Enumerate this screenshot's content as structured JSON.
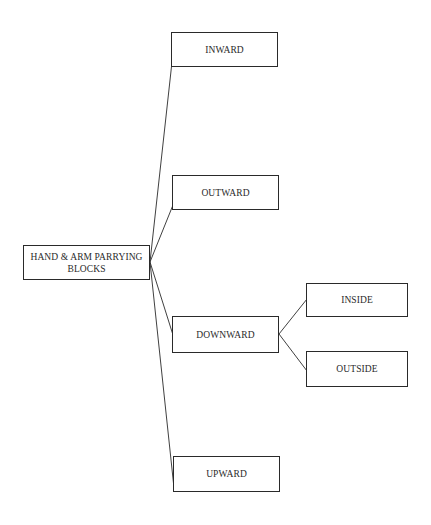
{
  "diagram": {
    "type": "tree",
    "root": {
      "id": "root",
      "label_line1": "HAND & ARM PARRYING",
      "label_line2": "BLOCKS",
      "box": {
        "x": 23,
        "y": 245,
        "w": 127,
        "h": 35
      }
    },
    "nodes": [
      {
        "id": "inward",
        "label": "INWARD",
        "parent": "root",
        "box": {
          "x": 171,
          "y": 32,
          "w": 107,
          "h": 35
        }
      },
      {
        "id": "outward",
        "label": "OUTWARD",
        "parent": "root",
        "box": {
          "x": 172,
          "y": 175,
          "w": 107,
          "h": 35
        }
      },
      {
        "id": "downward",
        "label": "DOWNWARD",
        "parent": "root",
        "box": {
          "x": 172,
          "y": 316,
          "w": 107,
          "h": 37
        }
      },
      {
        "id": "inside",
        "label": "INSIDE",
        "parent": "downward",
        "box": {
          "x": 306,
          "y": 283,
          "w": 102,
          "h": 34
        }
      },
      {
        "id": "outside",
        "label": "OUTSIDE",
        "parent": "downward",
        "box": {
          "x": 306,
          "y": 351,
          "w": 102,
          "h": 36
        }
      },
      {
        "id": "upward",
        "label": "UPWARD",
        "parent": "root",
        "box": {
          "x": 173,
          "y": 456,
          "w": 107,
          "h": 36
        }
      }
    ],
    "edges": [
      {
        "from": "root",
        "to": "inward",
        "x1": 150,
        "y1": 262,
        "x2": 172,
        "y2": 62
      },
      {
        "from": "root",
        "to": "outward",
        "x1": 150,
        "y1": 262,
        "x2": 173,
        "y2": 205
      },
      {
        "from": "root",
        "to": "downward",
        "x1": 150,
        "y1": 262,
        "x2": 173,
        "y2": 335
      },
      {
        "from": "root",
        "to": "upward",
        "x1": 150,
        "y1": 262,
        "x2": 174,
        "y2": 488
      },
      {
        "from": "downward",
        "to": "inside",
        "x1": 279,
        "y1": 334,
        "x2": 307,
        "y2": 299
      },
      {
        "from": "downward",
        "to": "outside",
        "x1": 279,
        "y1": 334,
        "x2": 307,
        "y2": 371
      }
    ],
    "colors": {
      "stroke": "#2a2a2a",
      "background": "#ffffff",
      "text": "#2a2a2a"
    }
  }
}
